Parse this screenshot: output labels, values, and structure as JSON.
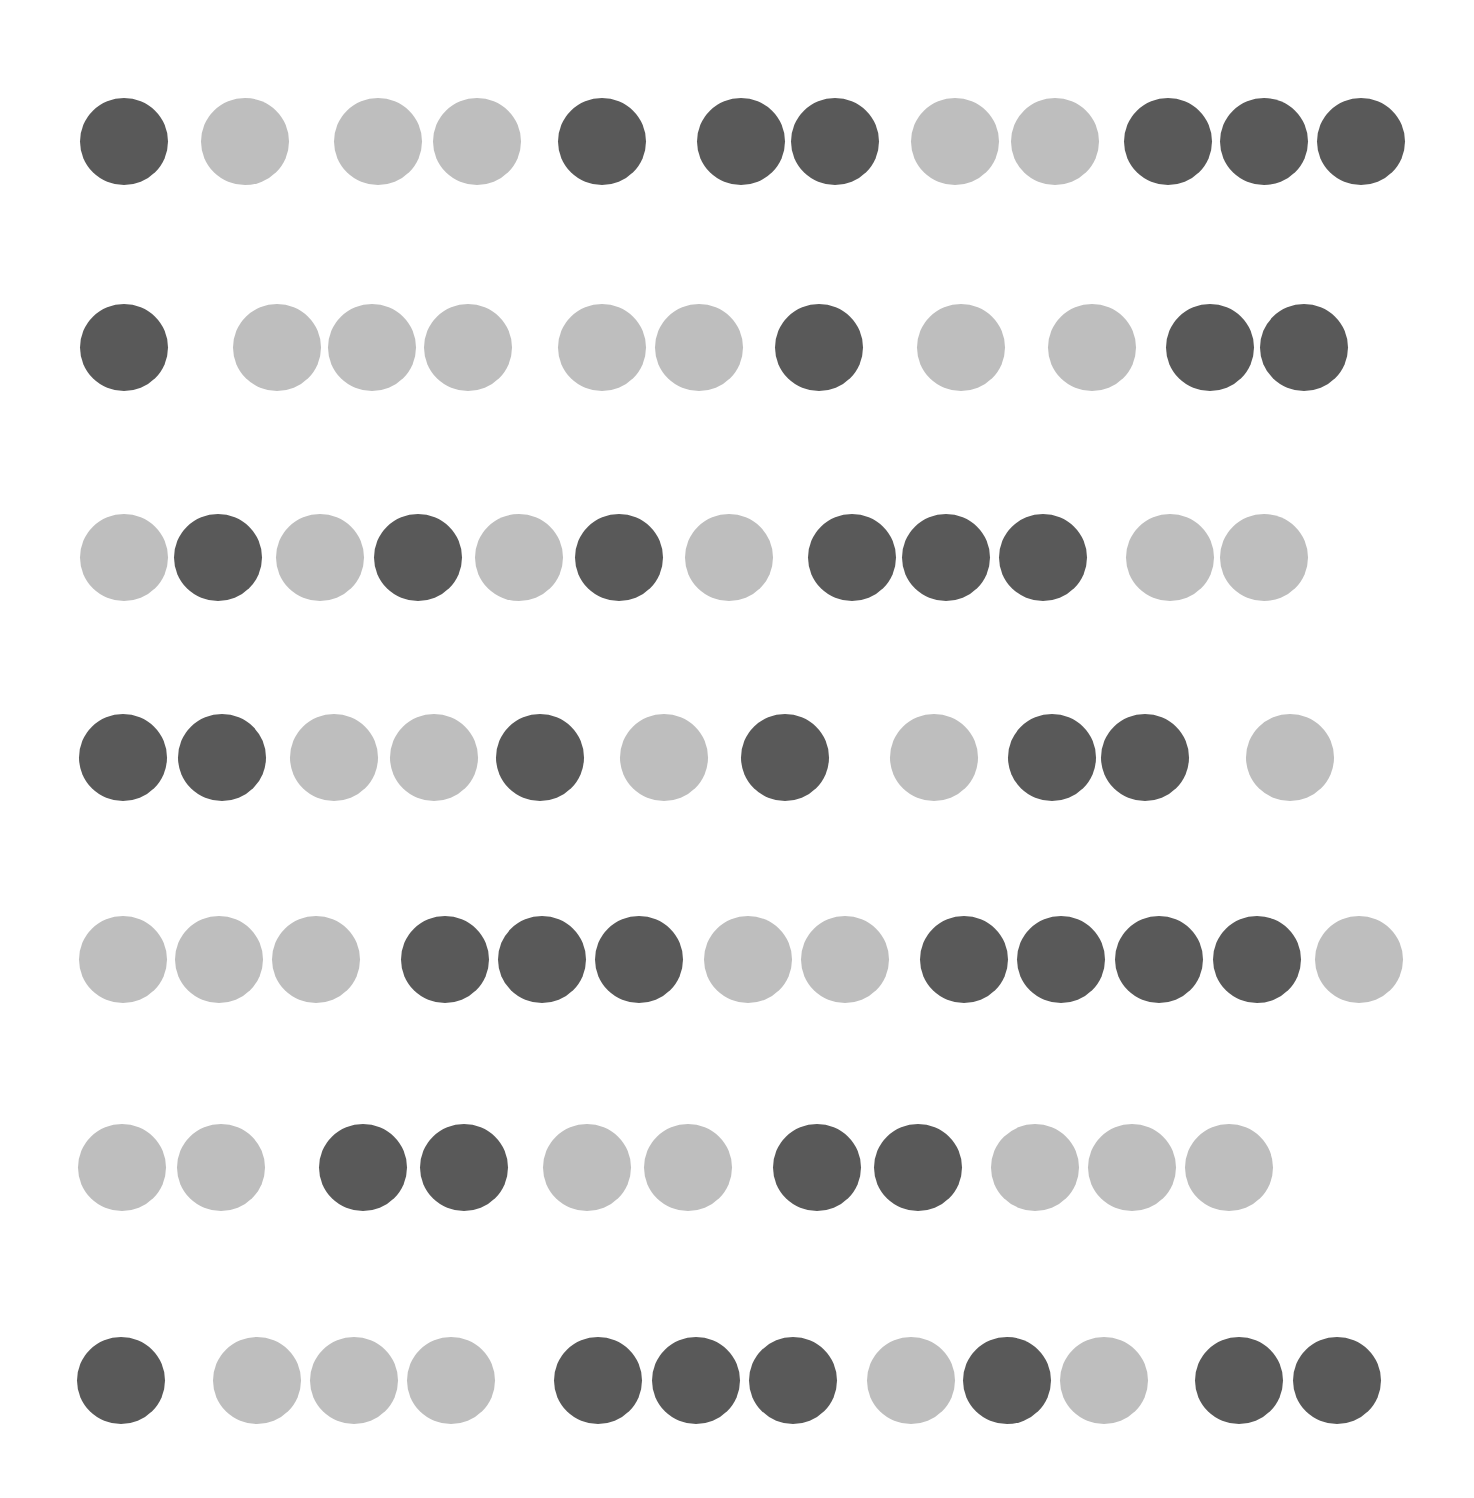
{
  "colors": {
    "dark": "#595959",
    "light": "#bebebe",
    "background": "#ffffff"
  },
  "dot_size": {
    "width": 88,
    "height": 87
  },
  "rows": [
    {
      "y": 141,
      "dots": [
        {
          "x": 124,
          "shade": "dark"
        },
        {
          "x": 245,
          "shade": "light"
        },
        {
          "x": 378,
          "shade": "light"
        },
        {
          "x": 477,
          "shade": "light"
        },
        {
          "x": 602,
          "shade": "dark"
        },
        {
          "x": 741,
          "shade": "dark"
        },
        {
          "x": 835,
          "shade": "dark"
        },
        {
          "x": 955,
          "shade": "light"
        },
        {
          "x": 1055,
          "shade": "light"
        },
        {
          "x": 1168,
          "shade": "dark"
        },
        {
          "x": 1264,
          "shade": "dark"
        },
        {
          "x": 1361,
          "shade": "dark"
        }
      ]
    },
    {
      "y": 347,
      "dots": [
        {
          "x": 124,
          "shade": "dark"
        },
        {
          "x": 277,
          "shade": "light"
        },
        {
          "x": 372,
          "shade": "light"
        },
        {
          "x": 468,
          "shade": "light"
        },
        {
          "x": 602,
          "shade": "light"
        },
        {
          "x": 699,
          "shade": "light"
        },
        {
          "x": 819,
          "shade": "dark"
        },
        {
          "x": 961,
          "shade": "light"
        },
        {
          "x": 1092,
          "shade": "light"
        },
        {
          "x": 1210,
          "shade": "dark"
        },
        {
          "x": 1304,
          "shade": "dark"
        }
      ]
    },
    {
      "y": 557,
      "dots": [
        {
          "x": 124,
          "shade": "light"
        },
        {
          "x": 218,
          "shade": "dark"
        },
        {
          "x": 320,
          "shade": "light"
        },
        {
          "x": 418,
          "shade": "dark"
        },
        {
          "x": 519,
          "shade": "light"
        },
        {
          "x": 619,
          "shade": "dark"
        },
        {
          "x": 729,
          "shade": "light"
        },
        {
          "x": 852,
          "shade": "dark"
        },
        {
          "x": 946,
          "shade": "dark"
        },
        {
          "x": 1043,
          "shade": "dark"
        },
        {
          "x": 1170,
          "shade": "light"
        },
        {
          "x": 1264,
          "shade": "light"
        }
      ]
    },
    {
      "y": 757,
      "dots": [
        {
          "x": 123,
          "shade": "dark"
        },
        {
          "x": 222,
          "shade": "dark"
        },
        {
          "x": 334,
          "shade": "light"
        },
        {
          "x": 434,
          "shade": "light"
        },
        {
          "x": 540,
          "shade": "dark"
        },
        {
          "x": 664,
          "shade": "light"
        },
        {
          "x": 785,
          "shade": "dark"
        },
        {
          "x": 934,
          "shade": "light"
        },
        {
          "x": 1052,
          "shade": "dark"
        },
        {
          "x": 1145,
          "shade": "dark"
        },
        {
          "x": 1290,
          "shade": "light"
        }
      ]
    },
    {
      "y": 959,
      "dots": [
        {
          "x": 123,
          "shade": "light"
        },
        {
          "x": 219,
          "shade": "light"
        },
        {
          "x": 316,
          "shade": "light"
        },
        {
          "x": 445,
          "shade": "dark"
        },
        {
          "x": 542,
          "shade": "dark"
        },
        {
          "x": 639,
          "shade": "dark"
        },
        {
          "x": 748,
          "shade": "light"
        },
        {
          "x": 845,
          "shade": "light"
        },
        {
          "x": 964,
          "shade": "dark"
        },
        {
          "x": 1061,
          "shade": "dark"
        },
        {
          "x": 1159,
          "shade": "dark"
        },
        {
          "x": 1257,
          "shade": "dark"
        },
        {
          "x": 1359,
          "shade": "light"
        }
      ]
    },
    {
      "y": 1167,
      "dots": [
        {
          "x": 122,
          "shade": "light"
        },
        {
          "x": 221,
          "shade": "light"
        },
        {
          "x": 363,
          "shade": "dark"
        },
        {
          "x": 464,
          "shade": "dark"
        },
        {
          "x": 587,
          "shade": "light"
        },
        {
          "x": 688,
          "shade": "light"
        },
        {
          "x": 817,
          "shade": "dark"
        },
        {
          "x": 918,
          "shade": "dark"
        },
        {
          "x": 1035,
          "shade": "light"
        },
        {
          "x": 1132,
          "shade": "light"
        },
        {
          "x": 1229,
          "shade": "light"
        }
      ]
    },
    {
      "y": 1380,
      "dots": [
        {
          "x": 121,
          "shade": "dark"
        },
        {
          "x": 257,
          "shade": "light"
        },
        {
          "x": 354,
          "shade": "light"
        },
        {
          "x": 451,
          "shade": "light"
        },
        {
          "x": 598,
          "shade": "dark"
        },
        {
          "x": 696,
          "shade": "dark"
        },
        {
          "x": 793,
          "shade": "dark"
        },
        {
          "x": 911,
          "shade": "light"
        },
        {
          "x": 1007,
          "shade": "dark"
        },
        {
          "x": 1104,
          "shade": "light"
        },
        {
          "x": 1239,
          "shade": "dark"
        },
        {
          "x": 1337,
          "shade": "dark"
        }
      ]
    }
  ]
}
